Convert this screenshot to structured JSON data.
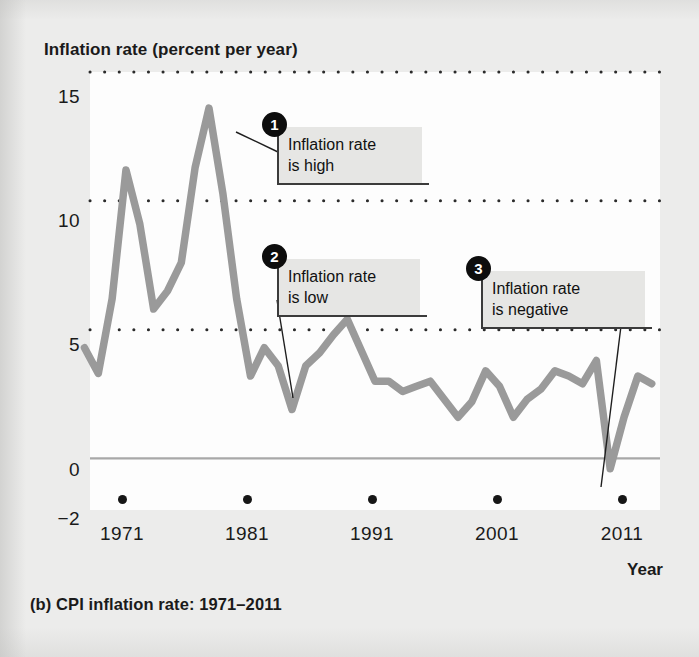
{
  "figure": {
    "y_axis_title": "Inflation rate (percent per year)",
    "x_axis_title": "Year",
    "caption": "(b) CPI inflation rate: 1971–2011"
  },
  "callouts": [
    {
      "number": "1",
      "text": "Inflation rate\nis high"
    },
    {
      "number": "2",
      "text": "Inflation rate\nis low"
    },
    {
      "number": "3",
      "text": "Inflation rate\nis negative"
    }
  ],
  "chart_data": {
    "type": "line",
    "title": "(b) CPI inflation rate: 1971–2011",
    "xlabel": "Year",
    "ylabel": "Inflation rate (percent per year)",
    "xlim": [
      1970.4,
      2011.6
    ],
    "ylim": [
      -2,
      15
    ],
    "grid": "dotted horizontal gridlines at 5, 10, 15; solid zero line at 0",
    "legend": "none",
    "y_ticks": [
      "15",
      "10",
      "5",
      "0",
      "−2"
    ],
    "y_tick_values": [
      15,
      10,
      5,
      0,
      -2
    ],
    "x_ticks": [
      "1971",
      "1981",
      "1991",
      "2001",
      "2011"
    ],
    "x_tick_values": [
      1971,
      1981,
      1991,
      2001,
      2011
    ],
    "line_color": "#9a9a9a",
    "zero_line_color": "#a8a8a8",
    "series": [
      {
        "name": "CPI inflation rate",
        "x": [
          1970,
          1971,
          1972,
          1973,
          1974,
          1975,
          1976,
          1977,
          1978,
          1979,
          1980,
          1981,
          1982,
          1983,
          1984,
          1985,
          1986,
          1987,
          1988,
          1989,
          1990,
          1991,
          1992,
          1993,
          1994,
          1995,
          1996,
          1997,
          1998,
          1999,
          2000,
          2001,
          2002,
          2003,
          2004,
          2005,
          2006,
          2007,
          2008,
          2009,
          2010,
          2011
        ],
        "values": [
          4.3,
          3.3,
          6.2,
          11.2,
          9.1,
          5.8,
          6.5,
          7.6,
          11.3,
          13.6,
          10.3,
          6.2,
          3.2,
          4.3,
          3.6,
          1.9,
          3.6,
          4.1,
          4.8,
          5.4,
          4.2,
          3.0,
          3.0,
          2.6,
          2.8,
          3.0,
          2.3,
          1.6,
          2.2,
          3.4,
          2.8,
          1.6,
          2.3,
          2.7,
          3.4,
          3.2,
          2.9,
          3.8,
          -0.4,
          1.6,
          3.2,
          2.9
        ]
      }
    ],
    "annotations": [
      {
        "number": "1",
        "text": "Inflation rate is high",
        "points_to_year": 1980,
        "points_to_value": 13.6
      },
      {
        "number": "2",
        "text": "Inflation rate is low",
        "points_to_year": 1986,
        "points_to_value": 1.9
      },
      {
        "number": "3",
        "text": "Inflation rate is negative",
        "points_to_year": 2009,
        "points_to_value": -0.4
      }
    ]
  }
}
